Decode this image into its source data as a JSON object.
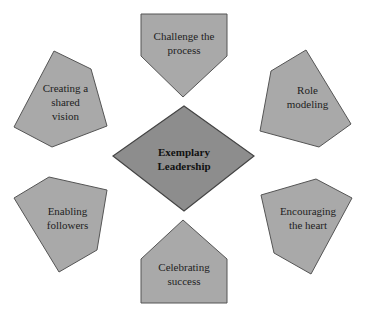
{
  "diagram": {
    "colors": {
      "node_fill": "#a9a9a9",
      "center_fill": "#8d8d8d",
      "edge": "#555555",
      "text": "#222222"
    },
    "center": {
      "line1": "Exemplary",
      "line2": "Leadership"
    },
    "nodes": [
      {
        "id": "challenge",
        "line1": "Challenge the",
        "line2": "process"
      },
      {
        "id": "role",
        "line1": "Role",
        "line2": "modeling"
      },
      {
        "id": "encourage",
        "line1": "Encouraging",
        "line2": "the heart"
      },
      {
        "id": "celebrate",
        "line1": "Celebrating",
        "line2": "success"
      },
      {
        "id": "enable",
        "line1": "Enabling",
        "line2": "followers"
      },
      {
        "id": "vision",
        "line1": "Creating a",
        "line2": "shared",
        "line3": "vision"
      }
    ]
  }
}
